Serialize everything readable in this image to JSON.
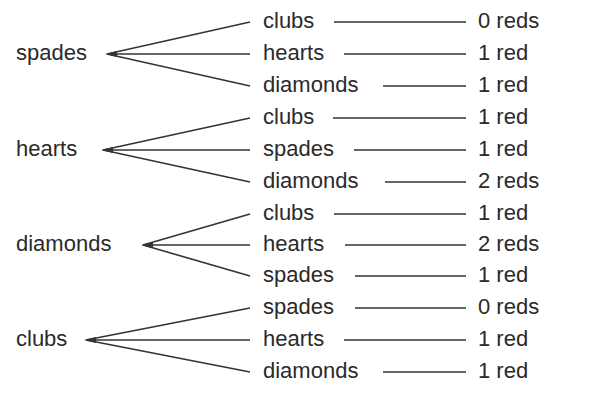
{
  "tree": {
    "groups": [
      {
        "root": "spades",
        "root_x": 16,
        "root_y": 54,
        "vertex_x": 107,
        "branches": [
          {
            "label": "clubs",
            "result": "0 reds",
            "y": 22,
            "line_start": 334
          },
          {
            "label": "hearts",
            "result": "1 red",
            "y": 54,
            "line_start": 344
          },
          {
            "label": "diamonds",
            "result": "1 red",
            "y": 86,
            "line_start": 383
          }
        ]
      },
      {
        "root": "hearts",
        "root_x": 16,
        "root_y": 150,
        "vertex_x": 103,
        "branches": [
          {
            "label": "clubs",
            "result": "1 red",
            "y": 118,
            "line_start": 333
          },
          {
            "label": "spades",
            "result": "1 red",
            "y": 150,
            "line_start": 354
          },
          {
            "label": "diamonds",
            "result": "2 reds",
            "y": 182,
            "line_start": 385
          }
        ]
      },
      {
        "root": "diamonds",
        "root_x": 16,
        "root_y": 245,
        "vertex_x": 143,
        "branches": [
          {
            "label": "clubs",
            "result": "1 red",
            "y": 214,
            "line_start": 334
          },
          {
            "label": "hearts",
            "result": "2 reds",
            "y": 245,
            "line_start": 345
          },
          {
            "label": "spades",
            "result": "1 red",
            "y": 276,
            "line_start": 355
          }
        ]
      },
      {
        "root": "clubs",
        "root_x": 16,
        "root_y": 340,
        "vertex_x": 86,
        "branches": [
          {
            "label": "spades",
            "result": "0 reds",
            "y": 308,
            "line_start": 355
          },
          {
            "label": "hearts",
            "result": "1 red",
            "y": 340,
            "line_start": 344
          },
          {
            "label": "diamonds",
            "result": "1 red",
            "y": 372,
            "line_start": 383
          }
        ]
      }
    ],
    "leaf_x": 263,
    "branch_end_x": 250,
    "line_end_x": 466,
    "result_x": 478
  },
  "colors": {
    "text": "#2a2a2a",
    "line": "#333333",
    "background": "#ffffff"
  }
}
